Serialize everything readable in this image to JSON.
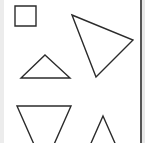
{
  "canvas": {
    "width": 145,
    "height": 143,
    "background": "#ffffff",
    "stroke_color": "#2b2b2b",
    "stroke_width": 1.4,
    "border_color": "#555555"
  },
  "shapes": [
    {
      "name": "square",
      "type": "polygon",
      "points": "15,6 36,6 36,26 15,26"
    },
    {
      "name": "large-triangle",
      "type": "polygon",
      "points": "72,15 133,40 96,77"
    },
    {
      "name": "small-triangle",
      "type": "polygon",
      "points": "45,55 70,78 21,78"
    },
    {
      "name": "inverted-triangle",
      "type": "polygon",
      "points": "17,106 71,106 44,167"
    },
    {
      "name": "upright-triangle",
      "type": "polygon",
      "points": "103,116 118,150 88,150"
    }
  ]
}
